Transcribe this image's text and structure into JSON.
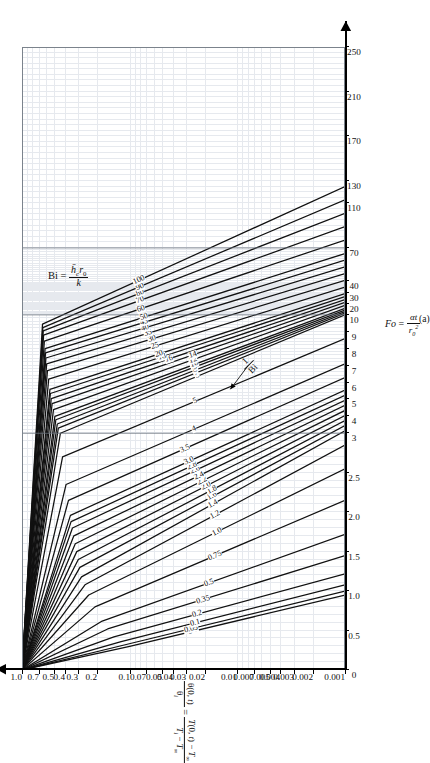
{
  "figure": {
    "caption": "(a)",
    "bi_definition_label": "Bi",
    "bi_definition_eq": "=",
    "bi_num": "h̄c r0",
    "bi_den": "k",
    "one_over_bi_annotation": "1 / Bi"
  },
  "axes": {
    "x": {
      "label_prefix": "Fo",
      "label_eq": "=",
      "label_num": "αt",
      "label_den": "r0²",
      "ticks": [
        "0",
        "0.5",
        "1.0",
        "1.5",
        "2.0",
        "2.5",
        "3",
        "4",
        "5",
        "6",
        "7",
        "8",
        "9",
        "10",
        "20",
        "30",
        "40",
        "70",
        "110",
        "130",
        "170",
        "210",
        "250"
      ],
      "tick_positions": [
        0,
        0.5,
        1.0,
        1.5,
        2.0,
        2.5,
        3,
        4,
        5,
        6,
        7,
        8,
        9,
        10,
        20,
        30,
        40,
        70,
        110,
        130,
        170,
        210,
        250
      ],
      "min": 0,
      "max": 250
    },
    "y": {
      "label_lhs_num": "θ(0, t)",
      "label_lhs_den": "θi",
      "label_eq": "=",
      "label_rhs_num": "T(0, t) − T∞",
      "label_rhs_den": "Ti − T∞",
      "ticks": [
        "1.0",
        "0.7",
        "0.5",
        "0.4",
        "0.3",
        "0.2",
        "0.1",
        "0.07",
        "0.05",
        "0.04",
        "0.03",
        "0.02",
        "0.01",
        "0.007",
        "0.005",
        "0.004",
        "0.003",
        "0.002",
        "0.001"
      ],
      "tick_values": [
        1.0,
        0.7,
        0.5,
        0.4,
        0.3,
        0.2,
        0.1,
        0.07,
        0.05,
        0.04,
        0.03,
        0.02,
        0.01,
        0.007,
        0.005,
        0.004,
        0.003,
        0.002,
        0.001
      ],
      "min": 0.001,
      "max": 1.0,
      "scale": "log"
    }
  },
  "colors": {
    "curve": "#111111",
    "grid_minor": "#e6e9ee",
    "grid_major": "#9aa3ad",
    "axis": "#000000",
    "background": "#ffffff"
  },
  "chart_data": {
    "type": "line",
    "xlabel": "Fo = αt / r0²",
    "ylabel": "θ(0, t)/θi = [T(0, t) − T∞] / [Ti − T∞]",
    "xscale": "piecewise-linear (0–3 fine, 3–10 medium, 10–250 coarse)",
    "yscale": "log",
    "xlim": [
      0,
      250
    ],
    "ylim": [
      0.001,
      1.0
    ],
    "grid": true,
    "legend": "inline curve labels (value of 1/Bi)",
    "series_parameter": "1/Bi",
    "annotations": [
      {
        "text": "Bi = h̄c r0 / k",
        "where": "upper-left of plot area"
      },
      {
        "text": "1/Bi",
        "where": "mid-right, arrow pointing to curve family"
      },
      {
        "text": "(a)",
        "where": "below x-axis title"
      }
    ],
    "series": [
      {
        "name": "0",
        "x": [
          0,
          0.3,
          0.95
        ],
        "y": [
          1.0,
          0.1,
          0.001
        ]
      },
      {
        "name": "0.05",
        "x": [
          0,
          0.32,
          1.0
        ],
        "y": [
          1.0,
          0.11,
          0.001
        ]
      },
      {
        "name": "0.1",
        "x": [
          0,
          0.36,
          1.08
        ],
        "y": [
          1.0,
          0.12,
          0.001
        ]
      },
      {
        "name": "0.2",
        "x": [
          0,
          0.42,
          1.22
        ],
        "y": [
          1.0,
          0.14,
          0.001
        ]
      },
      {
        "name": "0.35",
        "x": [
          0,
          0.52,
          1.45
        ],
        "y": [
          1.0,
          0.16,
          0.001
        ]
      },
      {
        "name": "0.5",
        "x": [
          0,
          0.62,
          1.72
        ],
        "y": [
          1.0,
          0.18,
          0.001
        ]
      },
      {
        "name": "0.75",
        "x": [
          0,
          0.8,
          2.15
        ],
        "y": [
          1.0,
          0.21,
          0.001
        ]
      },
      {
        "name": "1.0",
        "x": [
          0,
          0.95,
          2.55
        ],
        "y": [
          1.0,
          0.24,
          0.001
        ]
      },
      {
        "name": "1.2",
        "x": [
          0,
          1.08,
          2.85
        ],
        "y": [
          1.0,
          0.26,
          0.001
        ]
      },
      {
        "name": "1.4",
        "x": [
          0,
          1.18,
          3.15
        ],
        "y": [
          1.0,
          0.28,
          0.001
        ]
      },
      {
        "name": "1.6",
        "x": [
          0,
          1.3,
          3.45
        ],
        "y": [
          1.0,
          0.29,
          0.001
        ]
      },
      {
        "name": "1.8",
        "x": [
          0,
          1.4,
          3.75
        ],
        "y": [
          1.0,
          0.3,
          0.001
        ]
      },
      {
        "name": "2.0",
        "x": [
          0,
          1.5,
          4.05
        ],
        "y": [
          1.0,
          0.31,
          0.001
        ]
      },
      {
        "name": "2.2",
        "x": [
          0,
          1.6,
          4.35
        ],
        "y": [
          1.0,
          0.32,
          0.001
        ]
      },
      {
        "name": "2.4",
        "x": [
          0,
          1.7,
          4.65
        ],
        "y": [
          1.0,
          0.33,
          0.001
        ]
      },
      {
        "name": "2.6",
        "x": [
          0,
          1.8,
          4.95
        ],
        "y": [
          1.0,
          0.34,
          0.001
        ]
      },
      {
        "name": "2.8",
        "x": [
          0,
          1.88,
          5.25
        ],
        "y": [
          1.0,
          0.35,
          0.001
        ]
      },
      {
        "name": "3.0",
        "x": [
          0,
          1.96,
          5.55
        ],
        "y": [
          1.0,
          0.355,
          0.001
        ]
      },
      {
        "name": "3.5",
        "x": [
          0,
          2.15,
          6.3
        ],
        "y": [
          1.0,
          0.37,
          0.001
        ]
      },
      {
        "name": "4",
        "x": [
          0,
          2.35,
          7.1
        ],
        "y": [
          1.0,
          0.39,
          0.001
        ]
      },
      {
        "name": "5",
        "x": [
          0,
          2.7,
          8.6
        ],
        "y": [
          1.0,
          0.42,
          0.001
        ]
      },
      {
        "name": "6",
        "x": [
          0,
          3.0,
          10.1
        ],
        "y": [
          1.0,
          0.44,
          0.001
        ]
      },
      {
        "name": "7",
        "x": [
          0,
          3.3,
          11.6
        ],
        "y": [
          1.0,
          0.46,
          0.001
        ]
      },
      {
        "name": "8",
        "x": [
          0,
          3.55,
          13.0
        ],
        "y": [
          1.0,
          0.47,
          0.001
        ]
      },
      {
        "name": "9",
        "x": [
          0,
          3.8,
          14.4
        ],
        "y": [
          1.0,
          0.485,
          0.001
        ]
      },
      {
        "name": "10",
        "x": [
          0,
          4.0,
          15.8
        ],
        "y": [
          1.0,
          0.495,
          0.001
        ]
      },
      {
        "name": "12",
        "x": [
          0,
          4.4,
          18.5
        ],
        "y": [
          1.0,
          0.51,
          0.001
        ]
      },
      {
        "name": "14",
        "x": [
          0,
          4.75,
          21.2
        ],
        "y": [
          1.0,
          0.525,
          0.001
        ]
      },
      {
        "name": "16",
        "x": [
          0,
          5.05,
          23.8
        ],
        "y": [
          1.0,
          0.535,
          0.001
        ]
      },
      {
        "name": "18",
        "x": [
          0,
          5.35,
          26.4
        ],
        "y": [
          1.0,
          0.545,
          0.001
        ]
      },
      {
        "name": "20",
        "x": [
          0,
          5.6,
          29.0
        ],
        "y": [
          1.0,
          0.55,
          0.001
        ]
      },
      {
        "name": "25",
        "x": [
          0,
          6.2,
          35.0
        ],
        "y": [
          1.0,
          0.565,
          0.001
        ]
      },
      {
        "name": "30",
        "x": [
          0,
          6.7,
          41.0
        ],
        "y": [
          1.0,
          0.58,
          0.001
        ]
      },
      {
        "name": "35",
        "x": [
          0,
          7.1,
          47.0
        ],
        "y": [
          1.0,
          0.59,
          0.001
        ]
      },
      {
        "name": "40",
        "x": [
          0,
          7.45,
          53.0
        ],
        "y": [
          1.0,
          0.6,
          0.001
        ]
      },
      {
        "name": "45",
        "x": [
          0,
          7.75,
          59.0
        ],
        "y": [
          1.0,
          0.605,
          0.001
        ]
      },
      {
        "name": "50",
        "x": [
          0,
          8.0,
          65.0
        ],
        "y": [
          1.0,
          0.61,
          0.001
        ]
      },
      {
        "name": "60",
        "x": [
          0,
          8.45,
          77.0
        ],
        "y": [
          1.0,
          0.62,
          0.001
        ]
      },
      {
        "name": "70",
        "x": [
          0,
          8.8,
          89.0
        ],
        "y": [
          1.0,
          0.63,
          0.001
        ]
      },
      {
        "name": "80",
        "x": [
          0,
          9.05,
          101.0
        ],
        "y": [
          1.0,
          0.635,
          0.001
        ]
      },
      {
        "name": "90",
        "x": [
          0,
          9.25,
          113.0
        ],
        "y": [
          1.0,
          0.64,
          0.001
        ]
      },
      {
        "name": "100",
        "x": [
          0,
          9.45,
          125.0
        ],
        "y": [
          1.0,
          0.645,
          0.001
        ]
      }
    ],
    "curve_labels": [
      "0",
      "0.05",
      "0.1",
      "0.2",
      "0.35",
      "0.5",
      "0.75",
      "1.0",
      "1.2",
      "1.4",
      "1.6",
      "1.8",
      "2.0",
      "2.2",
      "2.4",
      "2.6",
      "2.8",
      "3.0",
      "3.5",
      "4",
      "5",
      "6",
      "7",
      "8",
      "9",
      "10",
      "12",
      "14",
      "16",
      "18",
      "20",
      "25",
      "30",
      "35",
      "40",
      "45",
      "50",
      "60",
      "70",
      "80",
      "90",
      "100"
    ]
  }
}
